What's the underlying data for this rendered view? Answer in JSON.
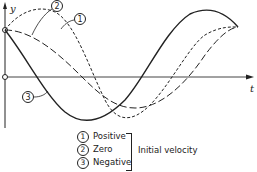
{
  "figure": {
    "axes": {
      "y_label": "y",
      "t_label": "t"
    },
    "curves": [
      {
        "id": 1,
        "style": "dashed-short"
      },
      {
        "id": 2,
        "style": "dashed-long"
      },
      {
        "id": 3,
        "style": "solid"
      }
    ],
    "callouts": [
      "1",
      "2",
      "3"
    ]
  },
  "legend": {
    "items": [
      {
        "num": "1",
        "label": "Positive"
      },
      {
        "num": "2",
        "label": "Zero"
      },
      {
        "num": "3",
        "label": "Negative"
      }
    ],
    "group_label": "Initial velocity"
  }
}
